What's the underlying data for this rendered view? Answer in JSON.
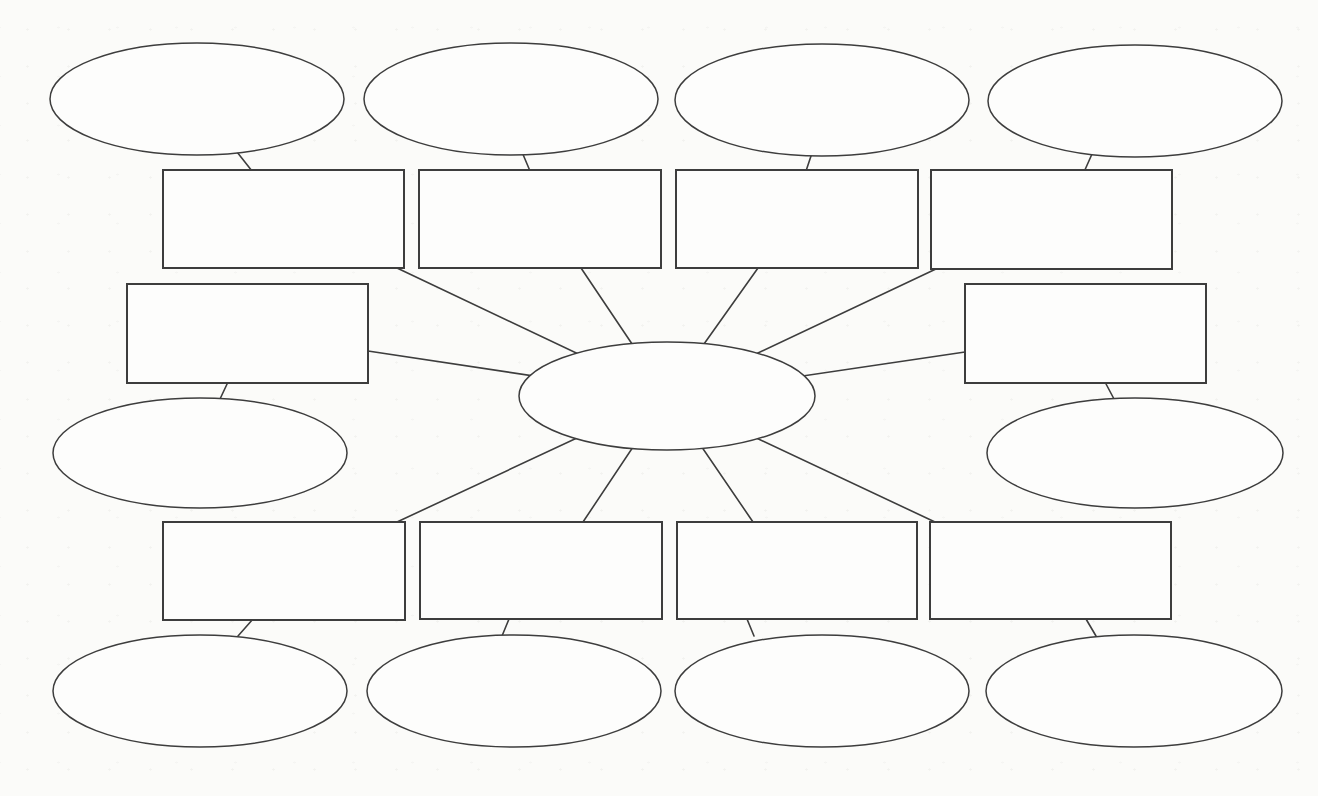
{
  "canvas": {
    "width": 1318,
    "height": 796,
    "background_color": "#fbfbf9"
  },
  "style": {
    "line_color": "#3d3d3d",
    "shape_fill_color": "#fdfdfc",
    "oval_stroke_width": 1.5,
    "rect_stroke_width": 2,
    "edge_stroke_width": 1.6
  },
  "diagram": {
    "kind": "spider-map-graphic-organizer",
    "nodes": [
      {
        "id": "main-topic-oval",
        "shape": "ellipse",
        "cx": 667,
        "cy": 396,
        "rx": 148,
        "ry": 54,
        "label": ""
      },
      {
        "id": "top-branch-box-1",
        "shape": "rect",
        "x": 163,
        "y": 170,
        "w": 241,
        "h": 98,
        "label": ""
      },
      {
        "id": "top-branch-box-2",
        "shape": "rect",
        "x": 419,
        "y": 170,
        "w": 242,
        "h": 98,
        "label": ""
      },
      {
        "id": "top-branch-box-3",
        "shape": "rect",
        "x": 676,
        "y": 170,
        "w": 242,
        "h": 98,
        "label": ""
      },
      {
        "id": "top-branch-box-4",
        "shape": "rect",
        "x": 931,
        "y": 170,
        "w": 241,
        "h": 99,
        "label": ""
      },
      {
        "id": "left-branch-box",
        "shape": "rect",
        "x": 127,
        "y": 284,
        "w": 241,
        "h": 99,
        "label": ""
      },
      {
        "id": "right-branch-box",
        "shape": "rect",
        "x": 965,
        "y": 284,
        "w": 241,
        "h": 99,
        "label": ""
      },
      {
        "id": "bottom-branch-box-1",
        "shape": "rect",
        "x": 163,
        "y": 522,
        "w": 242,
        "h": 98,
        "label": ""
      },
      {
        "id": "bottom-branch-box-2",
        "shape": "rect",
        "x": 420,
        "y": 522,
        "w": 242,
        "h": 97,
        "label": ""
      },
      {
        "id": "bottom-branch-box-3",
        "shape": "rect",
        "x": 677,
        "y": 522,
        "w": 240,
        "h": 97,
        "label": ""
      },
      {
        "id": "bottom-branch-box-4",
        "shape": "rect",
        "x": 930,
        "y": 522,
        "w": 241,
        "h": 97,
        "label": ""
      },
      {
        "id": "top-detail-oval-1",
        "shape": "ellipse",
        "cx": 197,
        "cy": 99,
        "rx": 147,
        "ry": 56,
        "label": ""
      },
      {
        "id": "top-detail-oval-2",
        "shape": "ellipse",
        "cx": 511,
        "cy": 99,
        "rx": 147,
        "ry": 56,
        "label": ""
      },
      {
        "id": "top-detail-oval-3",
        "shape": "ellipse",
        "cx": 822,
        "cy": 100,
        "rx": 147,
        "ry": 56,
        "label": ""
      },
      {
        "id": "top-detail-oval-4",
        "shape": "ellipse",
        "cx": 1135,
        "cy": 101,
        "rx": 147,
        "ry": 56,
        "label": ""
      },
      {
        "id": "left-detail-oval",
        "shape": "ellipse",
        "cx": 200,
        "cy": 453,
        "rx": 147,
        "ry": 55,
        "label": ""
      },
      {
        "id": "right-detail-oval",
        "shape": "ellipse",
        "cx": 1135,
        "cy": 453,
        "rx": 148,
        "ry": 55,
        "label": ""
      },
      {
        "id": "bottom-detail-oval-1",
        "shape": "ellipse",
        "cx": 200,
        "cy": 691,
        "rx": 147,
        "ry": 56,
        "label": ""
      },
      {
        "id": "bottom-detail-oval-2",
        "shape": "ellipse",
        "cx": 514,
        "cy": 691,
        "rx": 147,
        "ry": 56,
        "label": ""
      },
      {
        "id": "bottom-detail-oval-3",
        "shape": "ellipse",
        "cx": 822,
        "cy": 691,
        "rx": 147,
        "ry": 56,
        "label": ""
      },
      {
        "id": "bottom-detail-oval-4",
        "shape": "ellipse",
        "cx": 1134,
        "cy": 691,
        "rx": 148,
        "ry": 56,
        "label": ""
      }
    ],
    "edges": [
      {
        "id": "spoke-top-box-1",
        "x1": 397,
        "y1": 268,
        "x2": 667,
        "y2": 396
      },
      {
        "id": "spoke-top-box-2",
        "x1": 581,
        "y1": 268,
        "x2": 667,
        "y2": 396
      },
      {
        "id": "spoke-top-box-3",
        "x1": 758,
        "y1": 268,
        "x2": 667,
        "y2": 396
      },
      {
        "id": "spoke-top-box-4",
        "x1": 938,
        "y1": 268,
        "x2": 667,
        "y2": 396
      },
      {
        "id": "spoke-left-box",
        "x1": 368,
        "y1": 351,
        "x2": 667,
        "y2": 396
      },
      {
        "id": "spoke-right-box",
        "x1": 965,
        "y1": 352,
        "x2": 667,
        "y2": 396
      },
      {
        "id": "spoke-bottom-box-1",
        "x1": 397,
        "y1": 522,
        "x2": 667,
        "y2": 396
      },
      {
        "id": "spoke-bottom-box-2",
        "x1": 583,
        "y1": 522,
        "x2": 667,
        "y2": 396
      },
      {
        "id": "spoke-bottom-box-3",
        "x1": 753,
        "y1": 522,
        "x2": 667,
        "y2": 396
      },
      {
        "id": "spoke-bottom-box-4",
        "x1": 935,
        "y1": 522,
        "x2": 667,
        "y2": 396
      },
      {
        "id": "link-top-oval-1",
        "x1": 237,
        "y1": 152,
        "x2": 252,
        "y2": 171
      },
      {
        "id": "link-top-oval-2",
        "x1": 522,
        "y1": 152,
        "x2": 530,
        "y2": 171
      },
      {
        "id": "link-top-oval-3",
        "x1": 812,
        "y1": 153,
        "x2": 806,
        "y2": 171
      },
      {
        "id": "link-top-oval-4",
        "x1": 1092,
        "y1": 154,
        "x2": 1084,
        "y2": 172
      },
      {
        "id": "link-left-oval",
        "x1": 228,
        "y1": 382,
        "x2": 220,
        "y2": 399
      },
      {
        "id": "link-right-oval",
        "x1": 1105,
        "y1": 382,
        "x2": 1114,
        "y2": 399
      },
      {
        "id": "link-bottom-oval-1",
        "x1": 253,
        "y1": 619,
        "x2": 238,
        "y2": 636
      },
      {
        "id": "link-bottom-oval-2",
        "x1": 509,
        "y1": 619,
        "x2": 502,
        "y2": 636
      },
      {
        "id": "link-bottom-oval-3",
        "x1": 747,
        "y1": 619,
        "x2": 754,
        "y2": 636
      },
      {
        "id": "link-bottom-oval-4",
        "x1": 1086,
        "y1": 619,
        "x2": 1096,
        "y2": 636
      }
    ]
  }
}
